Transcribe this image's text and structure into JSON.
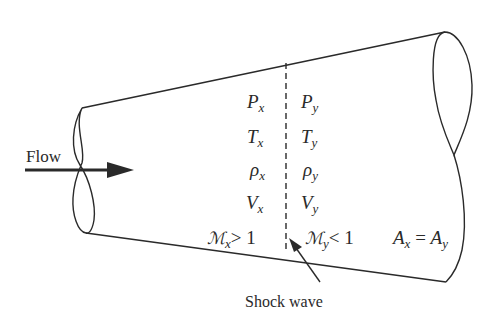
{
  "diagram": {
    "flow_label": "Flow",
    "shock_label": "Shock wave",
    "upstream": {
      "pressure": {
        "sym": "P",
        "sub": "x"
      },
      "temperature": {
        "sym": "T",
        "sub": "x"
      },
      "density": {
        "sym": "ρ",
        "sub": "x"
      },
      "velocity": {
        "sym": "V",
        "sub": "x"
      },
      "mach": {
        "sym": "ℳ",
        "sub": "x",
        "rel": "> 1"
      }
    },
    "downstream": {
      "pressure": {
        "sym": "P",
        "sub": "y"
      },
      "temperature": {
        "sym": "T",
        "sub": "y"
      },
      "density": {
        "sym": "ρ",
        "sub": "y"
      },
      "velocity": {
        "sym": "V",
        "sub": "y"
      },
      "mach": {
        "sym": "ℳ",
        "sub": "y",
        "rel": "< 1"
      }
    },
    "area": {
      "lhs": "A",
      "lhs_sub": "x",
      "eq": " = ",
      "rhs": "A",
      "rhs_sub": "y"
    },
    "colors": {
      "stroke": "#2a2a2a",
      "background": "#ffffff"
    }
  }
}
